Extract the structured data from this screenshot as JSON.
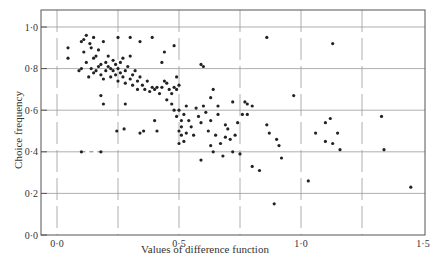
{
  "chart_data": {
    "type": "scatter",
    "title": "",
    "xlabel": "Values of difference function",
    "ylabel": "Choice frequency",
    "xlim": [
      -0.05,
      1.52
    ],
    "ylim": [
      0.0,
      1.08
    ],
    "xticks": [
      0.0,
      0.5,
      1.0,
      1.5
    ],
    "xtick_labels": [
      "0·0",
      "0·5",
      "1·0",
      "1·5"
    ],
    "yticks": [
      0.0,
      0.2,
      0.4,
      0.6,
      0.8,
      1.0
    ],
    "ytick_labels": [
      "0·0",
      "0·2",
      "0·4",
      "0·6",
      "0·8",
      "1·0"
    ],
    "x_gridlines": [
      0.0,
      0.25,
      0.5,
      0.75,
      1.0,
      1.25
    ],
    "y_gridlines": [
      0.2,
      0.4,
      0.6,
      0.8,
      1.0
    ],
    "grid": true,
    "legend": "none",
    "dashed_segment": {
      "x": [
        0.1,
        0.18
      ],
      "y": 0.4
    },
    "points": [
      [
        0.045,
        0.9
      ],
      [
        0.045,
        0.85
      ],
      [
        0.1,
        0.93
      ],
      [
        0.11,
        0.94
      ],
      [
        0.12,
        0.96
      ],
      [
        0.135,
        0.92
      ],
      [
        0.15,
        0.95
      ],
      [
        0.19,
        0.93
      ],
      [
        0.25,
        0.95
      ],
      [
        0.3,
        0.95
      ],
      [
        0.09,
        0.79
      ],
      [
        0.1,
        0.8
      ],
      [
        0.11,
        0.88
      ],
      [
        0.12,
        0.83
      ],
      [
        0.13,
        0.76
      ],
      [
        0.14,
        0.9
      ],
      [
        0.15,
        0.85
      ],
      [
        0.16,
        0.86
      ],
      [
        0.17,
        0.89
      ],
      [
        0.18,
        0.82
      ],
      [
        0.14,
        0.8
      ],
      [
        0.15,
        0.78
      ],
      [
        0.16,
        0.79
      ],
      [
        0.17,
        0.81
      ],
      [
        0.18,
        0.77
      ],
      [
        0.19,
        0.75
      ],
      [
        0.2,
        0.83
      ],
      [
        0.2,
        0.79
      ],
      [
        0.21,
        0.81
      ],
      [
        0.21,
        0.86
      ],
      [
        0.22,
        0.8
      ],
      [
        0.22,
        0.76
      ],
      [
        0.23,
        0.84
      ],
      [
        0.23,
        0.79
      ],
      [
        0.24,
        0.82
      ],
      [
        0.24,
        0.77
      ],
      [
        0.25,
        0.8
      ],
      [
        0.25,
        0.74
      ],
      [
        0.26,
        0.83
      ],
      [
        0.26,
        0.78
      ],
      [
        0.27,
        0.76
      ],
      [
        0.27,
        0.85
      ],
      [
        0.28,
        0.79
      ],
      [
        0.28,
        0.73
      ],
      [
        0.29,
        0.81
      ],
      [
        0.3,
        0.75
      ],
      [
        0.3,
        0.86
      ],
      [
        0.31,
        0.77
      ],
      [
        0.31,
        0.72
      ],
      [
        0.32,
        0.79
      ],
      [
        0.33,
        0.74
      ],
      [
        0.33,
        0.7
      ],
      [
        0.34,
        0.76
      ],
      [
        0.35,
        0.72
      ],
      [
        0.36,
        0.7
      ],
      [
        0.37,
        0.74
      ],
      [
        0.38,
        0.69
      ],
      [
        0.39,
        0.71
      ],
      [
        0.4,
        0.7
      ],
      [
        0.41,
        0.71
      ],
      [
        0.42,
        0.68
      ],
      [
        0.43,
        0.71
      ],
      [
        0.44,
        0.74
      ],
      [
        0.45,
        0.73
      ],
      [
        0.46,
        0.7
      ],
      [
        0.47,
        0.68
      ],
      [
        0.48,
        0.71
      ],
      [
        0.49,
        0.7
      ],
      [
        0.5,
        0.72
      ],
      [
        0.49,
        0.76
      ],
      [
        0.18,
        0.67
      ],
      [
        0.19,
        0.63
      ],
      [
        0.28,
        0.63
      ],
      [
        0.34,
        0.93
      ],
      [
        0.39,
        0.95
      ],
      [
        0.43,
        0.83
      ],
      [
        0.48,
        0.91
      ],
      [
        0.44,
        0.88
      ],
      [
        0.1,
        0.4
      ],
      [
        0.18,
        0.4
      ],
      [
        0.245,
        0.5
      ],
      [
        0.275,
        0.51
      ],
      [
        0.34,
        0.49
      ],
      [
        0.355,
        0.5
      ],
      [
        0.4,
        0.55
      ],
      [
        0.41,
        0.5
      ],
      [
        0.45,
        0.65
      ],
      [
        0.47,
        0.63
      ],
      [
        0.48,
        0.6
      ],
      [
        0.49,
        0.57
      ],
      [
        0.5,
        0.6
      ],
      [
        0.51,
        0.55
      ],
      [
        0.51,
        0.52
      ],
      [
        0.52,
        0.58
      ],
      [
        0.5,
        0.5
      ],
      [
        0.51,
        0.48
      ],
      [
        0.52,
        0.45
      ],
      [
        0.5,
        0.44
      ],
      [
        0.53,
        0.62
      ],
      [
        0.53,
        0.49
      ],
      [
        0.54,
        0.55
      ],
      [
        0.55,
        0.52
      ],
      [
        0.56,
        0.48
      ],
      [
        0.57,
        0.61
      ],
      [
        0.58,
        0.57
      ],
      [
        0.59,
        0.54
      ],
      [
        0.6,
        0.62
      ],
      [
        0.61,
        0.59
      ],
      [
        0.62,
        0.5
      ],
      [
        0.63,
        0.55
      ],
      [
        0.63,
        0.43
      ],
      [
        0.64,
        0.4
      ],
      [
        0.65,
        0.48
      ],
      [
        0.66,
        0.58
      ],
      [
        0.67,
        0.44
      ],
      [
        0.68,
        0.38
      ],
      [
        0.69,
        0.53
      ],
      [
        0.69,
        0.47
      ],
      [
        0.7,
        0.51
      ],
      [
        0.71,
        0.46
      ],
      [
        0.72,
        0.4
      ],
      [
        0.73,
        0.48
      ],
      [
        0.74,
        0.54
      ],
      [
        0.75,
        0.39
      ],
      [
        0.6,
        0.81
      ],
      [
        0.59,
        0.82
      ],
      [
        0.63,
        0.66
      ],
      [
        0.64,
        0.7
      ],
      [
        0.66,
        0.62
      ],
      [
        0.72,
        0.64
      ],
      [
        0.76,
        0.58
      ],
      [
        0.77,
        0.64
      ],
      [
        0.78,
        0.63
      ],
      [
        0.8,
        0.62
      ],
      [
        0.78,
        0.58
      ],
      [
        0.8,
        0.33
      ],
      [
        0.83,
        0.31
      ],
      [
        0.86,
        0.53
      ],
      [
        0.87,
        0.49
      ],
      [
        0.86,
        0.95
      ],
      [
        0.89,
        0.15
      ],
      [
        0.9,
        0.46
      ],
      [
        0.91,
        0.43
      ],
      [
        0.92,
        0.37
      ],
      [
        0.97,
        0.67
      ],
      [
        1.03,
        0.26
      ],
      [
        1.1,
        0.54
      ],
      [
        1.12,
        0.56
      ],
      [
        1.13,
        0.44
      ],
      [
        1.13,
        0.92
      ],
      [
        1.15,
        0.49
      ],
      [
        1.16,
        0.41
      ],
      [
        1.1,
        0.45
      ],
      [
        1.06,
        0.49
      ],
      [
        1.33,
        0.57
      ],
      [
        1.34,
        0.41
      ],
      [
        1.45,
        0.23
      ],
      [
        0.59,
        0.36
      ]
    ]
  }
}
